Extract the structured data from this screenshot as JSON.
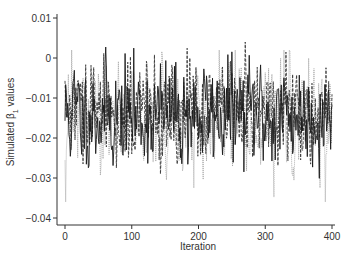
{
  "chart_data": {
    "type": "line",
    "title": "",
    "xlabel": "Iteration",
    "ylabel": "Simulated β1 values",
    "ylabel_parts": {
      "prefix": "Simulated β",
      "subscript": "1",
      "suffix": " values"
    },
    "xlim": [
      0,
      400
    ],
    "ylim": [
      -0.04,
      0.01
    ],
    "x_ticks": [
      0,
      100,
      200,
      300,
      400
    ],
    "x_tick_labels": [
      "0",
      "100",
      "200",
      "300",
      "400"
    ],
    "y_ticks": [
      0.01,
      0,
      -0.01,
      -0.02,
      -0.03,
      -0.04
    ],
    "y_tick_labels": [
      "0.01",
      "0",
      "−0.01",
      "−0.02",
      "−0.03",
      "−0.04"
    ],
    "grid": false,
    "legend": null,
    "series": [
      {
        "name": "chain-1",
        "style": "solid",
        "color": "#1a1a1a",
        "mean": -0.014,
        "sd": 0.0065,
        "seed": 11,
        "n": 400,
        "min_observed": -0.031,
        "max_observed": 0.005
      },
      {
        "name": "chain-2",
        "style": "dashed",
        "color": "#3a3a3a",
        "mean": -0.014,
        "sd": 0.0062,
        "seed": 29,
        "n": 400,
        "min_observed": -0.029,
        "max_observed": 0.004
      },
      {
        "name": "chain-3",
        "style": "dotted",
        "color": "#9a9a9a",
        "mean": -0.015,
        "sd": 0.007,
        "seed": 47,
        "n": 400,
        "min_observed": -0.036,
        "max_observed": 0.002
      }
    ]
  },
  "plot_area": {
    "x0_px": 65,
    "x400_px": 332,
    "y_top_val_px": 18,
    "y_bottom_val_px": 218,
    "axis_left_px": 57,
    "axis_bottom_px": 225,
    "axis_right_px": 335
  }
}
